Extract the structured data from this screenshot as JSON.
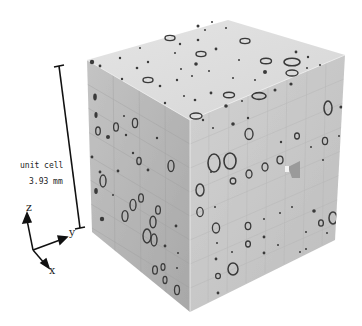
{
  "figure": {
    "type": "3D porous unit cell render",
    "scale_bar": {
      "label_line1": "unit cell",
      "label_line2": "3.93 mm"
    },
    "axes": {
      "z_label": "z",
      "y_label": "y",
      "x_label": "x"
    },
    "colors": {
      "top_face": "#dedede",
      "left_face": "#b4b4b4",
      "right_face": "#c8c8c8",
      "pores": "#3a3a3a",
      "scale_bar": "#111111"
    }
  }
}
